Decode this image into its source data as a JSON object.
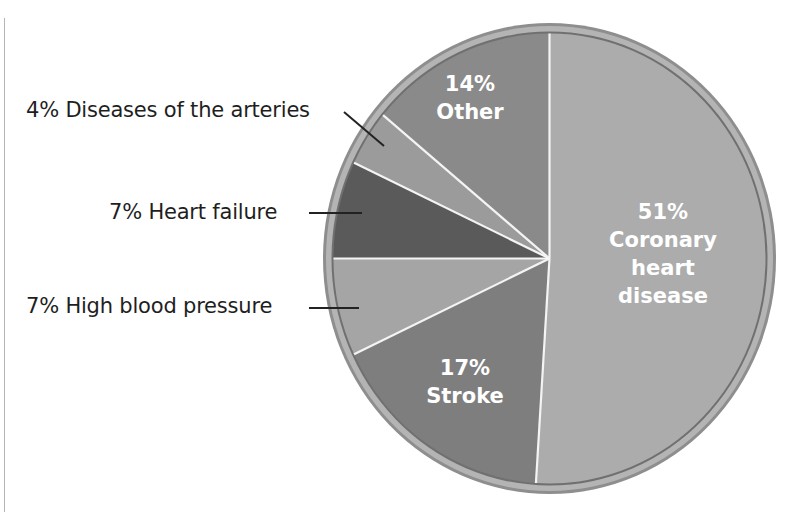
{
  "chart_data": {
    "type": "pie",
    "title": "",
    "start_angle_deg": 0,
    "direction": "clockwise",
    "slices": [
      {
        "label": "Coronary heart disease",
        "value": 51,
        "color": "#acacac",
        "text_lines": [
          "51%",
          "Coronary",
          "heart",
          "disease"
        ],
        "label_position": "inside"
      },
      {
        "label": "Stroke",
        "value": 17,
        "color": "#7e7e7e",
        "text_lines": [
          "17%",
          "Stroke"
        ],
        "label_position": "inside"
      },
      {
        "label": "High blood pressure",
        "value": 7,
        "color": "#a5a5a5",
        "text_lines": [
          "7% High blood pressure"
        ],
        "label_position": "outside"
      },
      {
        "label": "Heart failure",
        "value": 7,
        "color": "#5a5a5a",
        "text_lines": [
          "7% Heart failure"
        ],
        "label_position": "outside"
      },
      {
        "label": "Diseases of the arteries",
        "value": 4,
        "color": "#9b9b9b",
        "text_lines": [
          "4% Diseases of the arteries"
        ],
        "label_position": "outside"
      },
      {
        "label": "Other",
        "value": 14,
        "color": "#8a8a8a",
        "text_lines": [
          "14%",
          "Other"
        ],
        "label_position": "inside"
      }
    ],
    "legend": "none (callout labels)",
    "units": "%"
  },
  "labels": {
    "coronary": {
      "pct": "51%",
      "l1": "Coronary",
      "l2": "heart",
      "l3": "disease"
    },
    "stroke": {
      "pct": "17%",
      "l1": "Stroke"
    },
    "other": {
      "pct": "14%",
      "l1": "Other"
    },
    "arteries": "4% Diseases of the arteries",
    "heart_failure": "7% Heart failure",
    "hbp": "7% High blood pressure"
  },
  "style": {
    "ring_outer": "#8e8e8e",
    "ring_band": "#b4b4b4",
    "ring_inner": "#707070",
    "divider": "#f4f4f4",
    "leader": "#222222"
  }
}
